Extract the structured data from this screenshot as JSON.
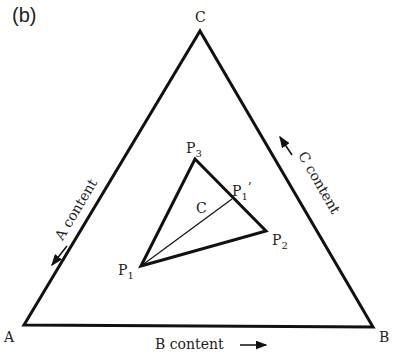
{
  "panel_label": "(b)",
  "vertices": {
    "A": "A",
    "B": "B",
    "C": "C"
  },
  "axis_labels": {
    "a_content": "A content",
    "b_content": "B content",
    "c_content": "C content"
  },
  "inner_points": {
    "p1": {
      "base": "P",
      "sub": "1"
    },
    "p2": {
      "base": "P",
      "sub": "2"
    },
    "p3": {
      "base": "P",
      "sub": "3"
    },
    "p1_prime": {
      "base": "P",
      "sub": "1",
      "prime": "’"
    }
  },
  "centroid_label": "C",
  "colors": {
    "line": "#111111",
    "text": "#222222"
  }
}
